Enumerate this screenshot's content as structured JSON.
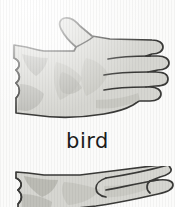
{
  "page": {
    "kind": "sign-language-flashcard-scan",
    "background_color": "#fbfbfa",
    "width": 175,
    "height": 207
  },
  "caption": {
    "text": "bird",
    "color": "#1b1b1b"
  },
  "figures": [
    {
      "name": "hand-illustration-top",
      "description": "flat open hand, palm view, fingers extended to the right, thumb raised up-left, forearm cuff at left edge",
      "outline_color": "#3a3a38",
      "fill_color": "#d6d6d1",
      "shade_color": "#a9a9a3",
      "shade_color_light": "#c2c2bc"
    },
    {
      "name": "hand-illustration-bottom",
      "description": "side view of hand with fingers pointing right, cropped by the bottom edge of the scan",
      "outline_color": "#3a3a38",
      "fill_color": "#d6d6d1",
      "shade_color": "#a9a9a3",
      "shade_color_light": "#c2c2bc"
    }
  ]
}
